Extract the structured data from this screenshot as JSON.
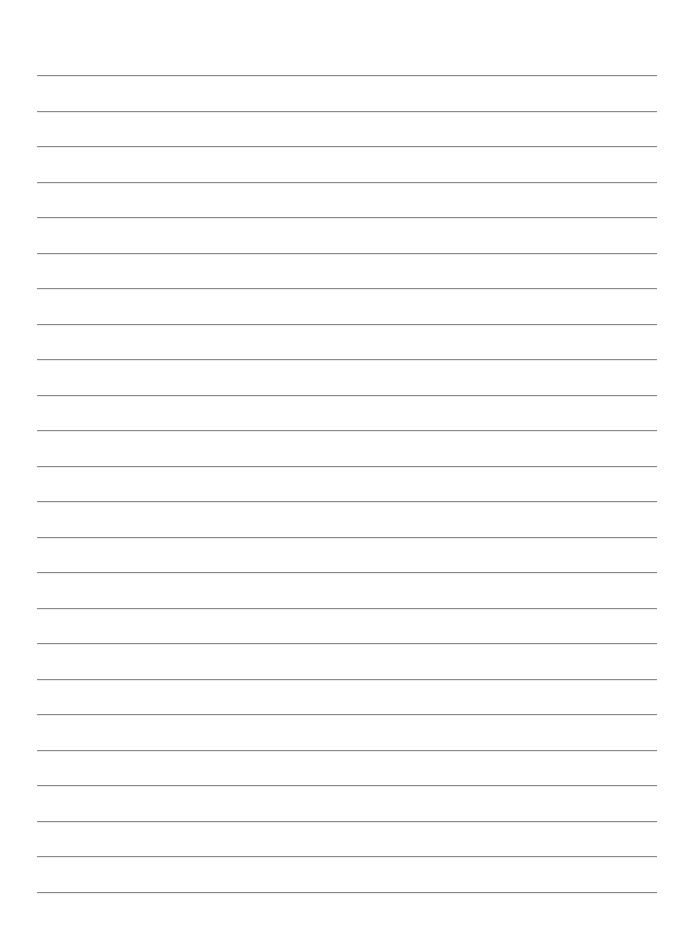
{
  "page": {
    "type": "lined-paper",
    "background_color": "#ffffff",
    "line_color": "#8a8a8a",
    "line_count": 24,
    "line_left": 37,
    "line_right": 657,
    "first_line_y": 75,
    "line_spacing": 35.5,
    "text": ""
  }
}
